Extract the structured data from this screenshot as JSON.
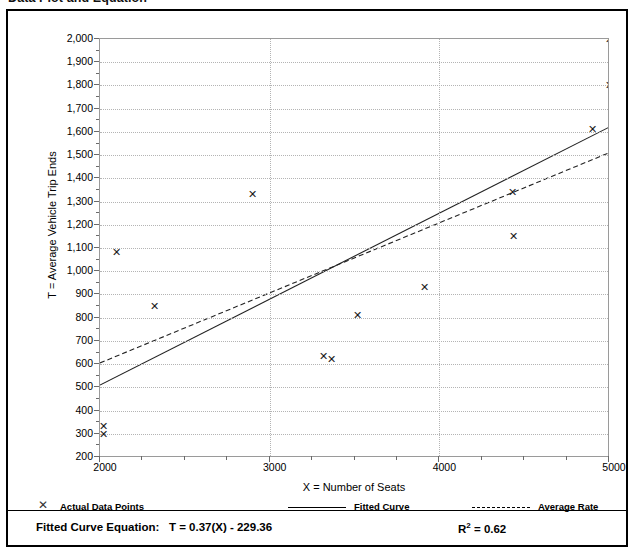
{
  "document": {
    "title": "Data Plot and Equation"
  },
  "axes": {
    "y_label": "T = Average Vehicle Trip Ends",
    "x_label": "X = Number of Seats",
    "y_ticks": [
      "200",
      "300",
      "400",
      "500",
      "600",
      "700",
      "800",
      "900",
      "1,000",
      "1,100",
      "1,200",
      "1,300",
      "1,400",
      "1,500",
      "1,600",
      "1,700",
      "1,800",
      "1,900",
      "2,000"
    ],
    "x_ticks": [
      "2000",
      "3000",
      "4000",
      "5000"
    ]
  },
  "legend": {
    "items": [
      {
        "label": "Actual Data Points",
        "marker": "x-marker-icon"
      },
      {
        "label": "Fitted Curve",
        "marker": "solid-line-icon"
      },
      {
        "label": "Average Rate",
        "marker": "dashed-line-icon"
      }
    ]
  },
  "footer": {
    "equation_label": "Fitted Curve Equation:",
    "equation": "T = 0.37(X) - 229.36",
    "r_squared_symbol": "R",
    "r_squared_exp": "2",
    "r_squared_value": "= 0.62"
  },
  "colors": {
    "grid": "#b4b4b4",
    "axis": "#9a9a9a",
    "marker": "#1a1a1a",
    "fitted_curve": "#000000",
    "average_rate": "#000000",
    "panel_border": "#000000"
  },
  "chart_data": {
    "type": "scatter",
    "title": "Data Plot and Equation",
    "xlabel": "X = Number of Seats",
    "ylabel": "T = Average Vehicle Trip Ends",
    "xlim": [
      2000,
      5000
    ],
    "ylim": [
      200,
      2000
    ],
    "x_tick_values": [
      2000,
      3000,
      4000,
      5000
    ],
    "x_minor_tick_values": [
      2250,
      2500,
      2750,
      3250,
      3500,
      3750,
      4250,
      4500,
      4750
    ],
    "y_tick_values": [
      200,
      300,
      400,
      500,
      600,
      700,
      800,
      900,
      1000,
      1100,
      1200,
      1300,
      1400,
      1500,
      1600,
      1700,
      1800,
      1900,
      2000
    ],
    "grid": true,
    "grid_style": "dotted",
    "legend_position": "below-plot",
    "series": [
      {
        "name": "Actual Data Points",
        "type": "scatter",
        "marker": "x",
        "points": [
          {
            "x": 2020,
            "y": 330
          },
          {
            "x": 2020,
            "y": 295
          },
          {
            "x": 2100,
            "y": 1080
          },
          {
            "x": 2320,
            "y": 850
          },
          {
            "x": 2900,
            "y": 1330
          },
          {
            "x": 3320,
            "y": 632
          },
          {
            "x": 3365,
            "y": 622
          },
          {
            "x": 3520,
            "y": 810
          },
          {
            "x": 3910,
            "y": 930
          },
          {
            "x": 4430,
            "y": 1340
          },
          {
            "x": 4440,
            "y": 1150
          },
          {
            "x": 4900,
            "y": 1610
          },
          {
            "x": 5000,
            "y": 2000
          },
          {
            "x": 5000,
            "y": 1800
          }
        ]
      },
      {
        "name": "Fitted Curve",
        "type": "line",
        "style": "solid",
        "equation": "T = 0.37(X) - 229.36",
        "slope": 0.37,
        "intercept": -229.36,
        "endpoints": [
          {
            "x": 2000,
            "y": 510
          },
          {
            "x": 5000,
            "y": 1620
          }
        ]
      },
      {
        "name": "Average Rate",
        "type": "line",
        "style": "dashed",
        "endpoints": [
          {
            "x": 2000,
            "y": 605
          },
          {
            "x": 5000,
            "y": 1510
          }
        ]
      }
    ],
    "annotations": [
      {
        "text": "Fitted Curve Equation:  T = 0.37(X) - 229.36",
        "position": "footer-left"
      },
      {
        "text": "R2 = 0.62",
        "position": "footer-right"
      }
    ]
  }
}
